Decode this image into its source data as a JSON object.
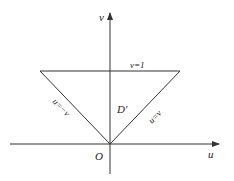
{
  "diagram": {
    "type": "region-in-uv-plane",
    "axes": {
      "horizontal_label": "u",
      "vertical_label": "v",
      "origin_label": "O"
    },
    "region": {
      "label": "D′",
      "shape": "triangle",
      "boundaries": [
        {
          "label": "v=1",
          "description": "top horizontal edge"
        },
        {
          "label": "u=−v",
          "description": "left slanted edge"
        },
        {
          "label": "u=v",
          "description": "right slanted edge"
        }
      ]
    },
    "colors": {
      "line": "#333333",
      "text": "#222222",
      "background": "#ffffff"
    }
  }
}
